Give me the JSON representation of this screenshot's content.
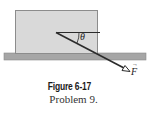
{
  "figure": {
    "caption_title": "Figure 6-17",
    "caption_subtitle": "Problem 9.",
    "angle_label": "θ",
    "force_label": "F",
    "force_vector_mark": "→",
    "colors": {
      "block_fill": "#d9d9d9",
      "block_stroke": "#8c8c8c",
      "ground_fill": "#a6a6a6",
      "ground_stroke": "#8a8a8a",
      "force_line": "#2b2b2b",
      "background": "#ffffff"
    }
  }
}
